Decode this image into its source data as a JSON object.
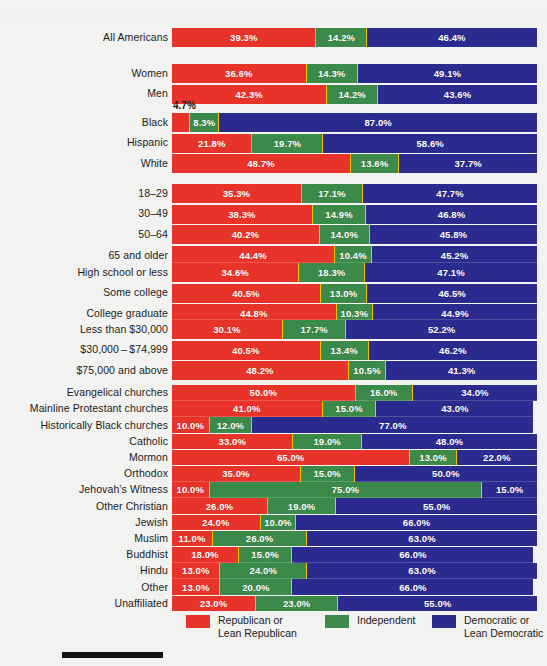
{
  "colors": {
    "republican": "#e8332a",
    "independent": "#3c8a4a",
    "democratic": "#2b2b8f",
    "background": "#f2f2f0",
    "text": "#1b1b1b"
  },
  "legend": {
    "items": [
      {
        "key": "republican",
        "line1": "Republican or",
        "line2": "Lean Republican",
        "swatch": "red-swatch"
      },
      {
        "key": "independent",
        "line1": "Independent",
        "line2": "",
        "swatch": "green-swatch"
      },
      {
        "key": "democratic",
        "line1": "Democratic or",
        "line2": "Lean Democratic",
        "swatch": "blue-swatch"
      }
    ]
  },
  "callouts": [
    {
      "text": "4.7%",
      "for": "Black"
    }
  ],
  "chart_data": {
    "type": "bar",
    "subtype": "stacked-horizontal-100",
    "title": "",
    "xlabel": "",
    "ylabel": "",
    "xlim": [
      0,
      100
    ],
    "grid": false,
    "legend_position": "bottom",
    "series": [
      {
        "name": "Republican or Lean Republican",
        "color": "#e8332a"
      },
      {
        "name": "Independent",
        "color": "#3c8a4a"
      },
      {
        "name": "Democratic or Lean Democratic",
        "color": "#2b2b8f"
      }
    ],
    "groups": [
      {
        "name": "overall",
        "rows": [
          {
            "label": "All Americans",
            "values": [
              39.3,
              14.2,
              46.4
            ],
            "labels": [
              "39.3%",
              "14.2%",
              "46.4%"
            ]
          }
        ]
      },
      {
        "name": "gender",
        "rows": [
          {
            "label": "Women",
            "values": [
              36.6,
              14.3,
              49.1
            ],
            "labels": [
              "36.6%",
              "14.3%",
              "49.1%"
            ]
          },
          {
            "label": "Men",
            "values": [
              42.3,
              14.2,
              43.6
            ],
            "labels": [
              "42.3%",
              "14.2%",
              "43.6%"
            ]
          }
        ]
      },
      {
        "name": "race",
        "rows": [
          {
            "label": "Black",
            "values": [
              4.7,
              8.3,
              87.0
            ],
            "labels": [
              "4.7%",
              "8.3%",
              "87.0%"
            ],
            "first_label_outside": true
          },
          {
            "label": "Hispanic",
            "values": [
              21.8,
              19.7,
              58.6
            ],
            "labels": [
              "21.8%",
              "19.7%",
              "58.6%"
            ]
          },
          {
            "label": "White",
            "values": [
              48.7,
              13.6,
              37.7
            ],
            "labels": [
              "48.7%",
              "13.6%",
              "37.7%"
            ]
          }
        ]
      },
      {
        "name": "age",
        "rows": [
          {
            "label": "18–29",
            "values": [
              35.3,
              17.1,
              47.7
            ],
            "labels": [
              "35.3%",
              "17.1%",
              "47.7%"
            ]
          },
          {
            "label": "30–49",
            "values": [
              38.3,
              14.9,
              46.8
            ],
            "labels": [
              "38.3%",
              "14.9%",
              "46.8%"
            ]
          },
          {
            "label": "50–64",
            "values": [
              40.2,
              14.0,
              45.8
            ],
            "labels": [
              "40.2%",
              "14.0%",
              "45.8%"
            ]
          },
          {
            "label": "65 and older",
            "values": [
              44.4,
              10.4,
              45.2
            ],
            "labels": [
              "44.4%",
              "10.4%",
              "45.2%"
            ]
          }
        ]
      },
      {
        "name": "education",
        "rows": [
          {
            "label": "High school or less",
            "values": [
              34.6,
              18.3,
              47.1
            ],
            "labels": [
              "34.6%",
              "18.3%",
              "47.1%"
            ]
          },
          {
            "label": "Some college",
            "values": [
              40.5,
              13.0,
              46.5
            ],
            "labels": [
              "40.5%",
              "13.0%",
              "46.5%"
            ]
          },
          {
            "label": "College graduate",
            "values": [
              44.8,
              10.3,
              44.9
            ],
            "labels": [
              "44.8%",
              "10.3%",
              "44.9%"
            ]
          }
        ]
      },
      {
        "name": "income",
        "rows": [
          {
            "label": "Less than $30,000",
            "values": [
              30.1,
              17.7,
              52.2
            ],
            "labels": [
              "30.1%",
              "17.7%",
              "52.2%"
            ]
          },
          {
            "label": "$30,000 – $74,999",
            "values": [
              40.5,
              13.4,
              46.2
            ],
            "labels": [
              "40.5%",
              "13.4%",
              "46.2%"
            ]
          },
          {
            "label": "$75,000 and above",
            "values": [
              48.2,
              10.5,
              41.3
            ],
            "labels": [
              "48.2%",
              "10.5%",
              "41.3%"
            ]
          }
        ]
      },
      {
        "name": "religion",
        "rows": [
          {
            "label": "Evangelical churches",
            "values": [
              50.0,
              16.0,
              34.0
            ],
            "labels": [
              "50.0%",
              "16.0%",
              "34.0%"
            ]
          },
          {
            "label": "Mainline Protestant churches",
            "values": [
              41.0,
              15.0,
              43.0
            ],
            "labels": [
              "41.0%",
              "15.0%",
              "43.0%"
            ]
          },
          {
            "label": "Historically Black churches",
            "values": [
              10.0,
              12.0,
              77.0
            ],
            "labels": [
              "10.0%",
              "12.0%",
              "77.0%"
            ]
          },
          {
            "label": "Catholic",
            "values": [
              33.0,
              19.0,
              48.0
            ],
            "labels": [
              "33.0%",
              "19.0%",
              "48.0%"
            ]
          },
          {
            "label": "Mormon",
            "values": [
              65.0,
              13.0,
              22.0
            ],
            "labels": [
              "65.0%",
              "13.0%",
              "22.0%"
            ]
          },
          {
            "label": "Orthodox",
            "values": [
              35.0,
              15.0,
              50.0
            ],
            "labels": [
              "35.0%",
              "15.0%",
              "50.0%"
            ]
          },
          {
            "label": "Jehovah’s Witness",
            "values": [
              10.0,
              75.0,
              15.0
            ],
            "labels": [
              "10.0%",
              "75.0%",
              "15.0%"
            ]
          },
          {
            "label": "Other Christian",
            "values": [
              26.0,
              19.0,
              55.0
            ],
            "labels": [
              "26.0%",
              "19.0%",
              "55.0%"
            ]
          },
          {
            "label": "Jewish",
            "values": [
              24.0,
              10.0,
              66.0
            ],
            "labels": [
              "24.0%",
              "10.0%",
              "66.0%"
            ]
          },
          {
            "label": "Muslim",
            "values": [
              11.0,
              26.0,
              63.0
            ],
            "labels": [
              "11.0%",
              "26.0%",
              "63.0%"
            ]
          },
          {
            "label": "Buddhist",
            "values": [
              18.0,
              15.0,
              66.0
            ],
            "labels": [
              "18.0%",
              "15.0%",
              "66.0%"
            ]
          },
          {
            "label": "Hindu",
            "values": [
              13.0,
              24.0,
              63.0
            ],
            "labels": [
              "13.0%",
              "24.0%",
              "63.0%"
            ]
          },
          {
            "label": "Other",
            "values": [
              13.0,
              20.0,
              66.0
            ],
            "labels": [
              "13.0%",
              "20.0%",
              "66.0%"
            ]
          },
          {
            "label": "Unaffiliated",
            "values": [
              23.0,
              23.0,
              55.0
            ],
            "labels": [
              "23.0%",
              "23.0%",
              "55.0%"
            ]
          }
        ]
      }
    ]
  }
}
